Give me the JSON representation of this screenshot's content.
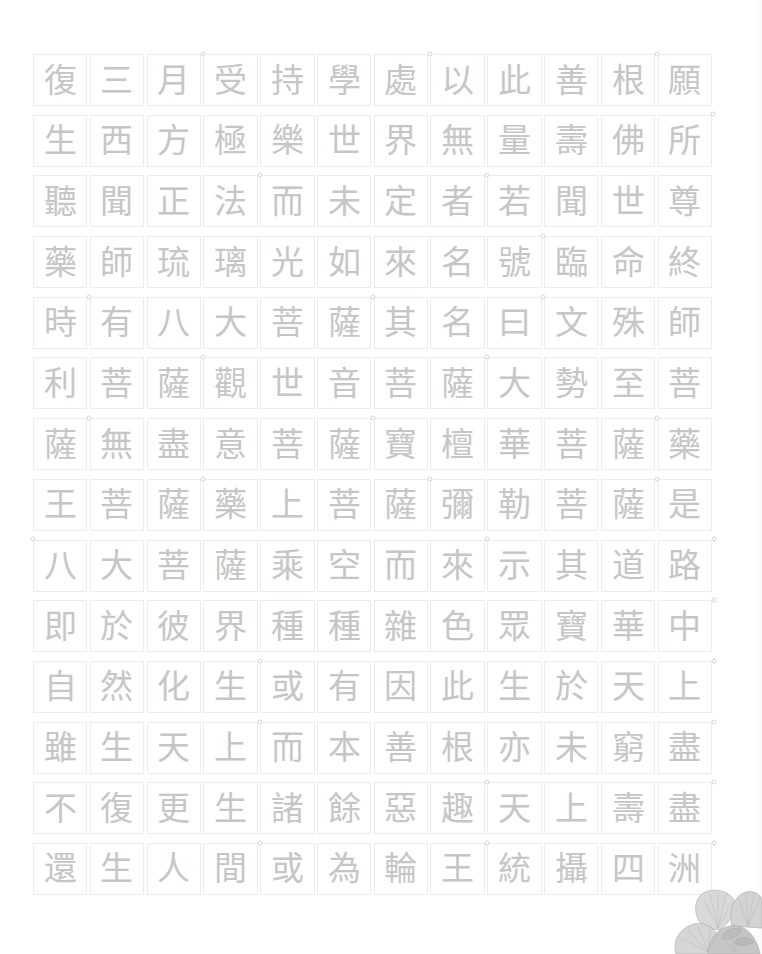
{
  "sheet": {
    "columns": 12,
    "row_count": 14,
    "rows": [
      [
        "復",
        "三",
        "月",
        "受",
        "持",
        "學",
        "處",
        "以",
        "此",
        "善",
        "根",
        "願"
      ],
      [
        "生",
        "西",
        "方",
        "極",
        "樂",
        "世",
        "界",
        "無",
        "量",
        "壽",
        "佛",
        "所"
      ],
      [
        "聽",
        "聞",
        "正",
        "法",
        "而",
        "未",
        "定",
        "者",
        "若",
        "聞",
        "世",
        "尊"
      ],
      [
        "藥",
        "師",
        "琉",
        "璃",
        "光",
        "如",
        "來",
        "名",
        "號",
        "臨",
        "命",
        "終"
      ],
      [
        "時",
        "有",
        "八",
        "大",
        "菩",
        "薩",
        "其",
        "名",
        "曰",
        "文",
        "殊",
        "師"
      ],
      [
        "利",
        "菩",
        "薩",
        "觀",
        "世",
        "音",
        "菩",
        "薩",
        "大",
        "勢",
        "至",
        "菩"
      ],
      [
        "薩",
        "無",
        "盡",
        "意",
        "菩",
        "薩",
        "寶",
        "檀",
        "華",
        "菩",
        "薩",
        "藥"
      ],
      [
        "王",
        "菩",
        "薩",
        "藥",
        "上",
        "菩",
        "薩",
        "彌",
        "勒",
        "菩",
        "薩",
        "是"
      ],
      [
        "八",
        "大",
        "菩",
        "薩",
        "乘",
        "空",
        "而",
        "來",
        "示",
        "其",
        "道",
        "路"
      ],
      [
        "即",
        "於",
        "彼",
        "界",
        "種",
        "種",
        "雜",
        "色",
        "眾",
        "寶",
        "華",
        "中"
      ],
      [
        "自",
        "然",
        "化",
        "生",
        "或",
        "有",
        "因",
        "此",
        "生",
        "於",
        "天",
        "上"
      ],
      [
        "雖",
        "生",
        "天",
        "上",
        "而",
        "本",
        "善",
        "根",
        "亦",
        "未",
        "窮",
        "盡"
      ],
      [
        "不",
        "復",
        "更",
        "生",
        "諸",
        "餘",
        "惡",
        "趣",
        "天",
        "上",
        "壽",
        "盡"
      ],
      [
        "還",
        "生",
        "人",
        "間",
        "或",
        "為",
        "輪",
        "王",
        "統",
        "攝",
        "四",
        "洲"
      ]
    ]
  },
  "colors": {
    "background": "#ffffff",
    "character": "#c6c6c6",
    "cell_border": "#ededed",
    "corner_mark": "#d6d6d6",
    "flower": "#d6d6d6"
  },
  "decoration": {
    "flower_icon": "peony-flower-icon"
  }
}
